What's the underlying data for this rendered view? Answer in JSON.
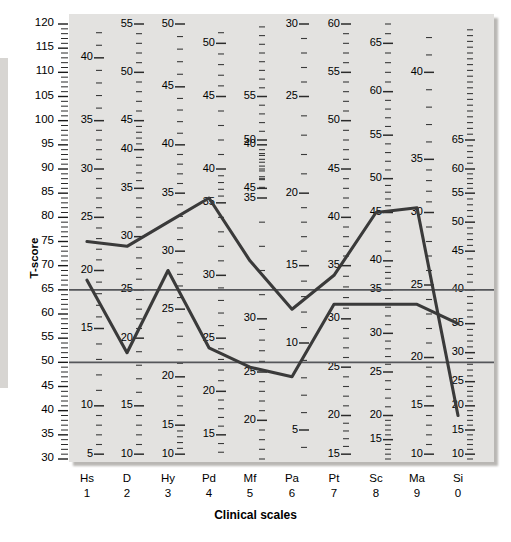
{
  "axes": {
    "y_title": "T-score",
    "x_title": "Clinical scales",
    "y_ticks": [
      120,
      115,
      110,
      105,
      100,
      95,
      90,
      85,
      80,
      75,
      70,
      65,
      60,
      55,
      50,
      45,
      40,
      35,
      30
    ]
  },
  "scales": [
    {
      "name": "Hs",
      "number": "1"
    },
    {
      "name": "D",
      "number": "2"
    },
    {
      "name": "Hy",
      "number": "3"
    },
    {
      "name": "Pd",
      "number": "4"
    },
    {
      "name": "Mf",
      "number": "5"
    },
    {
      "name": "Pa",
      "number": "6"
    },
    {
      "name": "Pt",
      "number": "7"
    },
    {
      "name": "Sc",
      "number": "8"
    },
    {
      "name": "Ma",
      "number": "9"
    },
    {
      "name": "Si",
      "number": "0"
    }
  ],
  "chart_data": {
    "type": "line",
    "title": "",
    "xlabel": "Clinical scales",
    "ylabel": "T-score",
    "ylim": [
      30,
      120
    ],
    "grid": false,
    "legend": "none",
    "categories": [
      "Hs 1",
      "D 2",
      "Hy 3",
      "Pd 4",
      "Mf 5",
      "Pa 6",
      "Pt 7",
      "Sc 8",
      "Ma 9",
      "Si 0"
    ],
    "reference_lines": [
      {
        "y": 65,
        "label": "T = 65"
      },
      {
        "y": 50,
        "label": "T = 50"
      }
    ],
    "series": [
      {
        "name": "Profile A",
        "color": "#3a3a3a",
        "values": [
          75,
          74,
          79,
          84,
          71,
          61,
          68,
          81,
          82,
          39
        ]
      },
      {
        "name": "Profile B",
        "color": "#3a3a3a",
        "values": [
          67,
          52,
          69,
          53,
          49,
          47,
          62,
          62,
          62,
          58
        ]
      }
    ],
    "raw_score_scales": [
      {
        "scale": "Hs",
        "labels": [
          40,
          35,
          30,
          25,
          20,
          15,
          10,
          5
        ],
        "t_values": [
          113,
          100,
          90,
          80,
          69,
          57,
          41,
          31
        ]
      },
      {
        "scale": "D",
        "labels": [
          55,
          50,
          45,
          40,
          35,
          30,
          25,
          20,
          15,
          10
        ],
        "t_values": [
          120,
          110,
          100,
          94,
          86,
          76,
          65,
          55,
          41,
          31
        ]
      },
      {
        "scale": "Hy",
        "labels": [
          50,
          45,
          40,
          35,
          30,
          25,
          20,
          15,
          10
        ],
        "t_values": [
          120,
          107,
          95,
          85,
          73,
          61,
          47,
          37,
          31
        ]
      },
      {
        "scale": "Pd",
        "labels": [
          50,
          45,
          40,
          35,
          30,
          25,
          20,
          15
        ],
        "t_values": [
          116,
          105,
          90,
          83,
          68,
          55,
          44,
          35
        ]
      },
      {
        "scale": "Mf",
        "labels": [
          55,
          50,
          45,
          40,
          35,
          30,
          25,
          20
        ],
        "t_values": [
          105,
          96,
          86,
          95,
          84,
          59,
          48,
          38
        ]
      },
      {
        "scale": "Pa",
        "labels": [
          30,
          25,
          20,
          15,
          10,
          5
        ],
        "t_values": [
          120,
          105,
          85,
          70,
          54,
          36
        ]
      },
      {
        "scale": "Pt",
        "labels": [
          60,
          55,
          50,
          45,
          40,
          35,
          30,
          25,
          20,
          15
        ],
        "t_values": [
          120,
          110,
          100,
          90,
          80,
          70,
          59,
          49,
          39,
          31
        ]
      },
      {
        "scale": "Sc",
        "labels": [
          65,
          60,
          55,
          50,
          45,
          40,
          35,
          30,
          25,
          20,
          15
        ],
        "t_values": [
          116,
          106,
          97,
          88,
          81,
          71,
          65,
          56,
          48,
          39,
          34
        ]
      },
      {
        "scale": "Ma",
        "labels": [
          40,
          35,
          30,
          25,
          20,
          15,
          10
        ],
        "t_values": [
          110,
          92,
          81,
          66,
          51,
          41,
          31
        ]
      },
      {
        "scale": "Si",
        "labels": [
          65,
          60,
          55,
          50,
          45,
          40,
          35,
          30,
          25,
          20,
          15,
          10
        ],
        "t_values": [
          96,
          90,
          85,
          79,
          73,
          65,
          58,
          52,
          46,
          41,
          36,
          31
        ]
      }
    ]
  }
}
